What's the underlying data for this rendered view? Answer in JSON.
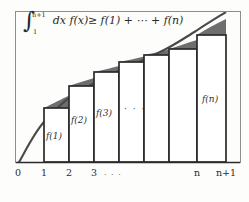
{
  "figure": {
    "title_formula": {
      "integral_symbol": "∫",
      "upper_limit": "n+1",
      "lower_limit": "1",
      "body": "dx f(x)",
      "relation": "≥",
      "right_side": "f(1) + ⋯ + f(n)",
      "full_text": "∫_1^{n+1} dx f(x) ≥ f(1) + ⋯ + f(n)"
    },
    "bar_labels": [
      {
        "text": "f(1)",
        "x": 46,
        "y": 137
      },
      {
        "text": "f(2)",
        "x": 71,
        "y": 121
      },
      {
        "text": "f(3)",
        "x": 96,
        "y": 114
      },
      {
        "text": "f(n)",
        "x": 203,
        "y": 100
      }
    ],
    "middle_ellipsis": "· · ·",
    "axis": {
      "tick_labels": [
        "0",
        "1",
        "2",
        "3",
        "n",
        "n+1"
      ],
      "tick_x": [
        18,
        44,
        69,
        94,
        197,
        226
      ],
      "axis_ellipsis": "· · ·",
      "axis_ellipsis_x": 108
    },
    "colors": {
      "curve": "#4a4a4a",
      "shade": "#6e6e6e",
      "bar_outline": "#2b2b2b",
      "frame": "#8d8d8d",
      "background": "#fdfdfc",
      "text": "#2a2a2a"
    },
    "chart_geometry": {
      "baseline_y": 162,
      "bar_tops_y": [
        108,
        86,
        72,
        62,
        55,
        49,
        44,
        35
      ],
      "bar_edges_x": [
        44,
        69,
        94,
        119,
        144,
        169,
        197,
        226
      ],
      "curve_points": "18,164 30,140 44,122 58,108 72,97 86,88 100,81 116,74 132,68 148,63 164,57 180,50 196,42 212,32 226,21 240,13"
    }
  }
}
